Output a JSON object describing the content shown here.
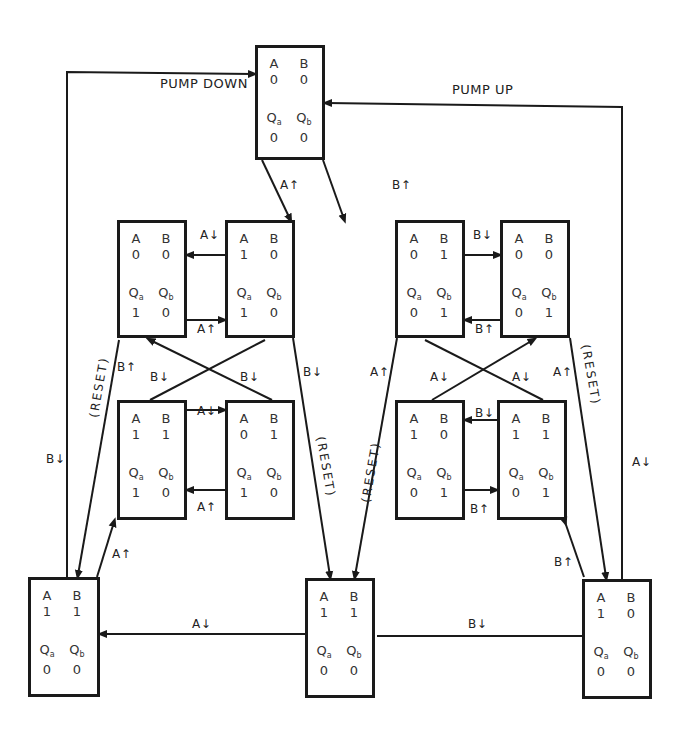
{
  "diagram": {
    "title_left": "PUMP DOWN",
    "title_right": "PUMP UP",
    "states": [
      {
        "id": "s00",
        "A": "0",
        "B": "0",
        "Qa": "0",
        "Qb": "0",
        "x": 255,
        "y": 45,
        "w": 70,
        "h": 115
      },
      {
        "id": "s1",
        "A": "0",
        "B": "0",
        "Qa": "1",
        "Qb": "0",
        "x": 117,
        "y": 220,
        "w": 70,
        "h": 118
      },
      {
        "id": "s2",
        "A": "1",
        "B": "0",
        "Qa": "1",
        "Qb": "0",
        "x": 225,
        "y": 220,
        "w": 70,
        "h": 118
      },
      {
        "id": "s3",
        "A": "1",
        "B": "1",
        "Qa": "1",
        "Qb": "0",
        "x": 117,
        "y": 400,
        "w": 70,
        "h": 120
      },
      {
        "id": "s4",
        "A": "0",
        "B": "1",
        "Qa": "1",
        "Qb": "0",
        "x": 225,
        "y": 400,
        "w": 70,
        "h": 120
      },
      {
        "id": "s5",
        "A": "0",
        "B": "1",
        "Qa": "0",
        "Qb": "1",
        "x": 395,
        "y": 220,
        "w": 70,
        "h": 118
      },
      {
        "id": "s6",
        "A": "0",
        "B": "0",
        "Qa": "0",
        "Qb": "1",
        "x": 500,
        "y": 220,
        "w": 70,
        "h": 118
      },
      {
        "id": "s7",
        "A": "1",
        "B": "0",
        "Qa": "0",
        "Qb": "1",
        "x": 395,
        "y": 400,
        "w": 70,
        "h": 120
      },
      {
        "id": "s8",
        "A": "1",
        "B": "1",
        "Qa": "0",
        "Qb": "1",
        "x": 497,
        "y": 400,
        "w": 70,
        "h": 120
      },
      {
        "id": "sDown",
        "A": "1",
        "B": "1",
        "Qa": "0",
        "Qb": "0",
        "x": 28,
        "y": 577,
        "w": 72,
        "h": 120
      },
      {
        "id": "sMid",
        "A": "1",
        "B": "1",
        "Qa": "0",
        "Qb": "0",
        "x": 305,
        "y": 578,
        "w": 70,
        "h": 120
      },
      {
        "id": "sUp",
        "A": "1",
        "B": "0",
        "Qa": "0",
        "Qb": "0",
        "x": 582,
        "y": 579,
        "w": 70,
        "h": 120
      }
    ],
    "labels": {
      "a_up_top": "A↑",
      "b_up_top": "B↑",
      "l_a_down_top": "A↓",
      "l_a_up_bot": "A↑",
      "l_b_down_x1": "B↓",
      "l_b_down_x2": "B↓",
      "l_b_up_reset": "B↑",
      "l_b_down_right": "B↓",
      "l_a_down_mid": "A↓",
      "l_a_up_mid": "A↑",
      "l_b_down_outer": "B↓",
      "l_a_up_down": "A↑",
      "r_b_down_top": "B↓",
      "r_b_up_bot": "B↑",
      "r_a_down_x1": "A↓",
      "r_a_down_x2": "A↓",
      "r_a_up_reset": "A↑",
      "r_a_up_left": "A↑",
      "r_b_down_mid": "B↓",
      "r_b_up_mid": "B↑",
      "r_a_down_outer": "A↓",
      "r_b_up_up": "B↑",
      "bottom_a_down": "A↓",
      "bottom_b_down": "B↓",
      "reset": "(RESET)"
    },
    "cell_headers": {
      "A": "A",
      "B": "B",
      "Q": "Q",
      "a": "a",
      "b": "b"
    },
    "line_color": "#1a1a1a"
  }
}
